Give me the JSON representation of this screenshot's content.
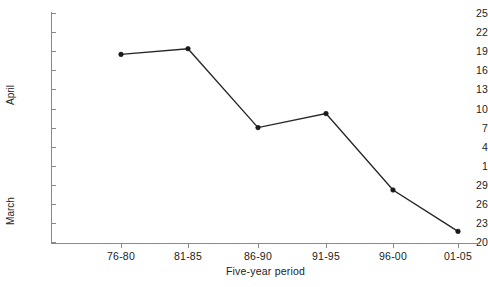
{
  "chart_data": {
    "type": "line",
    "title": "",
    "xlabel": "Five-year period",
    "ylabel": "",
    "categories": [
      "76-80",
      "81-85",
      "86-90",
      "91-95",
      "96-00",
      "01-05"
    ],
    "series": [
      {
        "name": "Date",
        "values": [
          18.5,
          19.4,
          7.0,
          9.2,
          28.2,
          21.7
        ],
        "point_labels": [
          "April 18.5",
          "April 19.4",
          "April 7",
          "April 9.2",
          "March 28.2",
          "March 21.7"
        ]
      }
    ],
    "y_axis": {
      "groups": [
        {
          "label": "April",
          "ticks": [
            "25",
            "22",
            "19",
            "16",
            "13",
            "10",
            "7",
            "4",
            "1"
          ]
        },
        {
          "label": "March",
          "ticks": [
            "29",
            "26",
            "23",
            "20"
          ]
        }
      ],
      "tick_labels_top_to_bottom": [
        "25",
        "22",
        "19",
        "16",
        "13",
        "10",
        "7",
        "4",
        "1",
        "29",
        "26",
        "23",
        "20"
      ],
      "description": "Calendar date axis descending from 25 April at top to 20 March at bottom, step of 3 days"
    },
    "x_axis": {
      "tick_labels": [
        "76-80",
        "81-85",
        "86-90",
        "91-95",
        "96-00",
        "01-05"
      ]
    },
    "grid": false,
    "legend": "none",
    "colors": {
      "line": "#262626",
      "marker": "#1a1a1a",
      "axis": "#8a8a8a",
      "text": "#222222",
      "background": "#ffffff"
    }
  }
}
